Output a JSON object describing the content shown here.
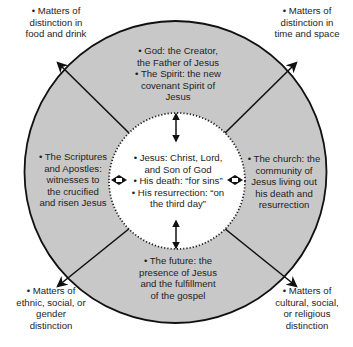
{
  "diagram": {
    "colors": {
      "outer_ring": "#c8c8c8",
      "inner_circle": "#ffffff",
      "stroke": "#111111",
      "background": "#ffffff"
    },
    "center": {
      "label": "Jesus",
      "lines": [
        "• Jesus: Christ, Lord,",
        "and Son of God",
        "• His death: “for sins”",
        "• His resurrection: “on",
        "the third day”"
      ]
    },
    "ring_sections": {
      "top": {
        "lines": [
          "• God: the Creator,",
          "the Father of Jesus",
          "• The Spirit: the new",
          "covenant Spirit of",
          "Jesus"
        ]
      },
      "left": {
        "lines": [
          "• The Scriptures",
          "and Apostles:",
          "witnesses to",
          "the crucified",
          "and risen Jesus"
        ]
      },
      "right": {
        "lines": [
          "• The church: the",
          "community of",
          "Jesus living out",
          "his death and",
          "resurrection"
        ]
      },
      "bottom": {
        "lines": [
          "• The future: the",
          "presence of Jesus",
          "and the fulfillment",
          "of the gospel"
        ]
      }
    },
    "outer_corners": {
      "top_left": {
        "lines": [
          "• Matters of",
          "distinction in",
          "food and drink"
        ]
      },
      "top_right": {
        "lines": [
          "• Matters of",
          "distinction in",
          "time and space"
        ]
      },
      "bottom_left": {
        "lines": [
          "• Matters of",
          "ethnic, social, or",
          "gender",
          "distinction"
        ]
      },
      "bottom_right": {
        "lines": [
          "• Matters of",
          "cultural, social,",
          "or religious",
          "distinction"
        ]
      }
    },
    "connectors": {
      "vertical_arrows": [
        "double-arrow-top",
        "double-arrow-bottom"
      ],
      "horizontal_arrows": [
        "double-arrow-left",
        "double-arrow-right"
      ],
      "diagonal_arrows": [
        "arrow-top-left",
        "arrow-top-right",
        "arrow-bottom-left",
        "arrow-bottom-right"
      ]
    }
  }
}
